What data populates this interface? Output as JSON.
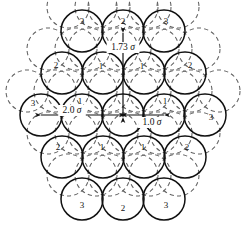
{
  "figure": {
    "background_color": "#ffffff",
    "line_color": "#111111",
    "dashed_color": "#555555",
    "sphere_diameter_label": "1.0",
    "sigma_symbol": "σ"
  },
  "chart_data": {
    "type": "scatter",
    "xlabel": "",
    "ylabel": "",
    "grid": false,
    "legend": false,
    "units": "σ (sphere diameter)",
    "sphere_radius_px": 21,
    "row_spacing_px": 42,
    "col_spacing_px": 42,
    "rows": [
      {
        "row": 0,
        "count": 3,
        "labels": [
          "3",
          "2",
          "3"
        ]
      },
      {
        "row": 1,
        "count": 4,
        "labels": [
          "2",
          "1",
          "1",
          "2"
        ]
      },
      {
        "row": 2,
        "count": 5,
        "labels": [
          "3",
          "1",
          "",
          "1",
          "3"
        ]
      },
      {
        "row": 3,
        "count": 4,
        "labels": [
          "2",
          "1",
          "1",
          "2"
        ]
      },
      {
        "row": 4,
        "count": 3,
        "labels": [
          "3",
          "2",
          "3"
        ]
      }
    ],
    "spheres": [
      {
        "cx": 82,
        "cy": 31,
        "label": "3",
        "lx": 82,
        "ly": 24
      },
      {
        "cx": 123,
        "cy": 31,
        "label": "2",
        "lx": 123,
        "ly": 24
      },
      {
        "cx": 164,
        "cy": 31,
        "label": "3",
        "lx": 166,
        "ly": 24
      },
      {
        "cx": 62,
        "cy": 73,
        "label": "2",
        "lx": 56,
        "ly": 68
      },
      {
        "cx": 103,
        "cy": 73,
        "label": "1",
        "lx": 101,
        "ly": 69
      },
      {
        "cx": 144,
        "cy": 73,
        "label": "1",
        "lx": 142,
        "ly": 69
      },
      {
        "cx": 185,
        "cy": 73,
        "label": "2",
        "lx": 190,
        "ly": 68
      },
      {
        "cx": 41,
        "cy": 115,
        "label": "3",
        "lx": 33,
        "ly": 106
      },
      {
        "cx": 82,
        "cy": 115,
        "label": "1",
        "lx": 80,
        "ly": 104
      },
      {
        "cx": 123,
        "cy": 115,
        "label": "",
        "lx": 123,
        "ly": 104
      },
      {
        "cx": 164,
        "cy": 115,
        "label": "1",
        "lx": 165,
        "ly": 104
      },
      {
        "cx": 205,
        "cy": 115,
        "label": "3",
        "lx": 211,
        "ly": 120
      },
      {
        "cx": 62,
        "cy": 157,
        "label": "2",
        "lx": 58,
        "ly": 150
      },
      {
        "cx": 103,
        "cy": 157,
        "label": "1",
        "lx": 102,
        "ly": 150
      },
      {
        "cx": 144,
        "cy": 157,
        "label": "1",
        "lx": 143,
        "ly": 150
      },
      {
        "cx": 185,
        "cy": 157,
        "label": "2",
        "lx": 187,
        "ly": 150
      },
      {
        "cx": 82,
        "cy": 199,
        "label": "3",
        "lx": 82,
        "ly": 208
      },
      {
        "cx": 123,
        "cy": 199,
        "label": "2",
        "lx": 123,
        "ly": 211
      },
      {
        "cx": 164,
        "cy": 199,
        "label": "3",
        "lx": 166,
        "ly": 208
      }
    ],
    "annotations": [
      {
        "id": "vertical-dimension",
        "value": "1.73",
        "unit": "σ",
        "text": "1.73",
        "orientation": "vertical",
        "x": 123,
        "y1": 33,
        "y2": 117,
        "label_x": 123,
        "label_y": 50
      },
      {
        "id": "left-dimension",
        "value": "2.0",
        "unit": "σ",
        "text": "2.0",
        "orientation": "horizontal",
        "y": 115,
        "x1": 41,
        "x2": 121,
        "label_x": 72,
        "label_y": 113
      },
      {
        "id": "right-dimension",
        "value": "1.0",
        "unit": "σ",
        "text": "1.0",
        "orientation": "horizontal",
        "y": 115,
        "x1": 125,
        "x2": 164,
        "label_x": 152,
        "label_y": 125
      }
    ]
  }
}
